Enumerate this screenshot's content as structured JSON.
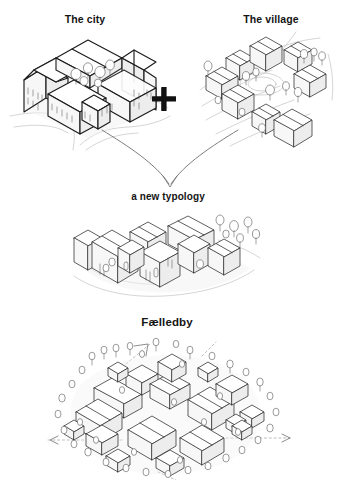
{
  "page": {
    "background_color": "#ffffff",
    "ink_color": "#1b1b1b",
    "accent_color": "#111111",
    "width": 339,
    "height": 477
  },
  "diagram": {
    "kind": "architectural concept diagram",
    "equation_operator": "+",
    "steps": [
      {
        "id": "city",
        "label": "The city",
        "illustration": "isometric-perimeter-block-icon",
        "description": "isometric line drawing of a closed urban perimeter block with pitched roofs, inner courtyard with trees and surrounding streets"
      },
      {
        "id": "village",
        "label": "The village",
        "illustration": "isometric-village-cluster-icon",
        "description": "isometric line drawing of scattered small gabled houses around a central green with trees and paths"
      },
      {
        "id": "typology",
        "label": "a new typology",
        "illustration": "isometric-hybrid-cluster-icon",
        "description": "isometric line drawing of a dense cluster of gabled volumes forming a hybrid block"
      },
      {
        "id": "faelledby",
        "label": "Fælledby",
        "illustration": "isometric-masterplan-icon",
        "description": "isometric aerial masterplan of many clustered village blocks surrounded by trees, with dotted axis lines and directional arrows"
      }
    ],
    "connectors": [
      {
        "id": "plus-operator",
        "symbol": "+",
        "name": "plus-icon"
      },
      {
        "id": "merge-arrow",
        "symbol": "↓",
        "name": "down-arrow-icon"
      },
      {
        "id": "axis-arrow-left",
        "symbol": "←",
        "name": "left-arrow-icon"
      },
      {
        "id": "axis-arrow-right",
        "symbol": "→",
        "name": "right-arrow-icon"
      }
    ]
  }
}
